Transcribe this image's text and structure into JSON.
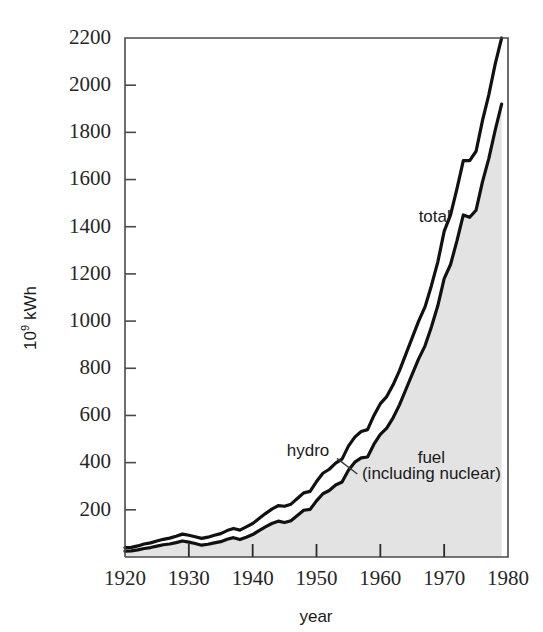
{
  "chart_data": {
    "type": "area",
    "title": "",
    "subtitle": "",
    "xlabel": "year",
    "ylabel_prefix": "10",
    "ylabel_exponent": "9",
    "ylabel_suffix": " kWh",
    "ylabel_full": "10⁹ kWh",
    "xlim": [
      1920,
      1980
    ],
    "ylim": [
      0,
      2200
    ],
    "grid": false,
    "legend_position": "inline-annotations",
    "xticks": [
      1920,
      1930,
      1940,
      1950,
      1960,
      1970,
      1980
    ],
    "xtick_labels": [
      "1920",
      "1930",
      "1940",
      "1950",
      "1960",
      "1970",
      "1980"
    ],
    "yticks": [
      200,
      400,
      600,
      800,
      1000,
      1200,
      1400,
      1600,
      1800,
      2000,
      2200
    ],
    "ytick_labels": [
      "200",
      "400",
      "600",
      "800",
      "1000",
      "1200",
      "1400",
      "1600",
      "1800",
      "2000",
      "2200"
    ],
    "annotations": [
      {
        "name": "total",
        "text": "total",
        "x": 1966,
        "y": 1420
      },
      {
        "name": "hydro",
        "text": "hydro",
        "x": 1952,
        "y": 430
      },
      {
        "name": "fuel-line1",
        "text": "fuel",
        "x": 1968,
        "y": 400
      },
      {
        "name": "fuel-line2",
        "text": "(including nuclear)",
        "x": 1968,
        "y": 330
      }
    ],
    "x": [
      1920,
      1921,
      1922,
      1923,
      1924,
      1925,
      1926,
      1927,
      1928,
      1929,
      1930,
      1931,
      1932,
      1933,
      1934,
      1935,
      1936,
      1937,
      1938,
      1939,
      1940,
      1941,
      1942,
      1943,
      1944,
      1945,
      1946,
      1947,
      1948,
      1949,
      1950,
      1951,
      1952,
      1953,
      1954,
      1955,
      1956,
      1957,
      1958,
      1959,
      1960,
      1961,
      1962,
      1963,
      1964,
      1965,
      1966,
      1967,
      1968,
      1969,
      1970,
      1971,
      1972,
      1973,
      1974,
      1975,
      1976,
      1977,
      1978,
      1979
    ],
    "series": [
      {
        "name": "total",
        "label": "total",
        "style": "line",
        "values": [
          40,
          41,
          47,
          55,
          60,
          68,
          75,
          80,
          88,
          97,
          92,
          86,
          79,
          84,
          92,
          99,
          112,
          121,
          114,
          128,
          142,
          163,
          184,
          203,
          218,
          215,
          224,
          248,
          272,
          278,
          320,
          355,
          372,
          398,
          415,
          470,
          508,
          532,
          540,
          600,
          650,
          680,
          730,
          790,
          860,
          930,
          1000,
          1060,
          1150,
          1250,
          1380,
          1450,
          1560,
          1680,
          1680,
          1720,
          1850,
          1960,
          2090,
          2200
        ]
      },
      {
        "name": "fuel",
        "label": "fuel (including nuclear)",
        "style": "area",
        "fill": "#e3e3e3",
        "values": [
          25,
          26,
          30,
          36,
          40,
          46,
          52,
          55,
          61,
          68,
          63,
          57,
          50,
          54,
          60,
          65,
          75,
          82,
          74,
          84,
          95,
          112,
          128,
          142,
          152,
          146,
          154,
          176,
          198,
          202,
          238,
          268,
          282,
          305,
          318,
          368,
          402,
          420,
          424,
          478,
          520,
          546,
          590,
          645,
          710,
          775,
          840,
          895,
          975,
          1065,
          1180,
          1240,
          1340,
          1450,
          1440,
          1470,
          1590,
          1690,
          1810,
          1920
        ]
      }
    ],
    "colors": {
      "line": "#111111",
      "fuel_fill": "#e3e3e3",
      "frame": "#4a4a4a",
      "text": "#1a1a1a"
    }
  }
}
